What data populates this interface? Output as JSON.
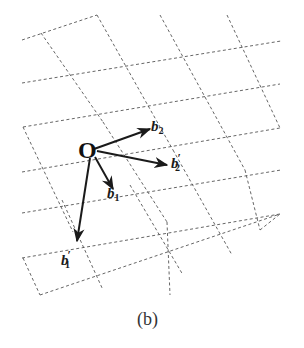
{
  "figure": {
    "caption": "(b)",
    "origin_label": "O",
    "colors": {
      "grid": "#555555",
      "vector": "#1a1a1a",
      "background": "#ffffff"
    },
    "vectors": [
      {
        "name": "b2",
        "base": "b",
        "sub": "2",
        "prime": "",
        "from": [
          94,
          149
        ],
        "to": [
          150,
          129
        ],
        "label_pos": [
          151,
          119
        ]
      },
      {
        "name": "b2-prime",
        "base": "b",
        "sub": "2",
        "prime": "′",
        "from": [
          97,
          151
        ],
        "to": [
          167,
          165
        ],
        "label_pos": [
          171,
          156
        ]
      },
      {
        "name": "b1",
        "base": "b",
        "sub": "1",
        "prime": "",
        "from": [
          95,
          157
        ],
        "to": [
          113,
          189
        ],
        "label_pos": [
          107,
          186
        ]
      },
      {
        "name": "b1-prime",
        "base": "b",
        "sub": "1",
        "prime": "′",
        "from": [
          90,
          158
        ],
        "to": [
          77,
          241
        ],
        "label_pos": [
          61,
          253
        ]
      }
    ],
    "grid_segments": [
      [
        [
          22,
          40
        ],
        [
          97,
          15
        ]
      ],
      [
        [
          22,
          83
        ],
        [
          281,
          41
        ]
      ],
      [
        [
          23,
          127
        ],
        [
          280,
          84
        ]
      ],
      [
        [
          22,
          172
        ],
        [
          280,
          128
        ]
      ],
      [
        [
          22,
          213
        ],
        [
          281,
          170
        ]
      ],
      [
        [
          22,
          258
        ],
        [
          280,
          214
        ]
      ],
      [
        [
          40,
          295
        ],
        [
          280,
          214
        ]
      ],
      [
        [
          41,
          33
        ],
        [
          103,
          122
        ]
      ],
      [
        [
          97,
          15
        ],
        [
          173,
          150
        ]
      ],
      [
        [
          160,
          15
        ],
        [
          245,
          170
        ]
      ],
      [
        [
          227,
          15
        ],
        [
          280,
          128
        ]
      ],
      [
        [
          23,
          127
        ],
        [
          73,
          232
        ]
      ],
      [
        [
          23,
          258
        ],
        [
          40,
          295
        ]
      ],
      [
        [
          103,
          122
        ],
        [
          167,
          222
        ]
      ],
      [
        [
          62,
          200
        ],
        [
          103,
          290
        ]
      ],
      [
        [
          130,
          185
        ],
        [
          183,
          275
        ]
      ],
      [
        [
          173,
          150
        ],
        [
          232,
          255
        ]
      ],
      [
        [
          167,
          222
        ],
        [
          170,
          295
        ]
      ],
      [
        [
          245,
          170
        ],
        [
          260,
          230
        ]
      ],
      [
        [
          260,
          230
        ],
        [
          280,
          214
        ]
      ]
    ]
  }
}
